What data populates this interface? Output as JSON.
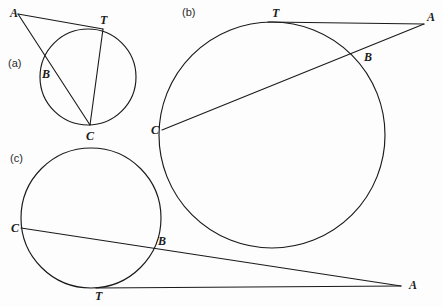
{
  "figure": {
    "background_color": "#fdfdfd",
    "stroke_color": "#1a1a1a",
    "width": 442,
    "height": 307,
    "caption_font_color": "#2a2a2a",
    "panels": [
      {
        "id": "a",
        "caption": "(a)",
        "caption_x": 8,
        "caption_y": 67,
        "circle": {
          "cx": 88,
          "cy": 77,
          "r": 48
        },
        "points": [
          {
            "name": "A",
            "label": "A",
            "x": 18,
            "y": 14,
            "label_x": 10,
            "label_y": 17
          },
          {
            "name": "T",
            "label": "T",
            "x": 103,
            "y": 29,
            "label_x": 100,
            "label_y": 24
          },
          {
            "name": "B",
            "label": "B",
            "x": 53,
            "y": 72,
            "label_x": 42,
            "label_y": 78
          },
          {
            "name": "C",
            "label": "C",
            "x": 90,
            "y": 125,
            "label_x": 86,
            "label_y": 140
          }
        ],
        "segments": [
          {
            "name": "tangent-AT",
            "from": "A",
            "to": "T"
          },
          {
            "name": "secant-ABC",
            "from": "A",
            "to": "C"
          },
          {
            "name": "chord-TC",
            "from": "T",
            "to": "C"
          }
        ]
      },
      {
        "id": "b",
        "caption": "(b)",
        "caption_x": 182,
        "caption_y": 16,
        "circle": {
          "cx": 272,
          "cy": 135,
          "r": 113
        },
        "points": [
          {
            "name": "A",
            "label": "A",
            "x": 424,
            "y": 24,
            "label_x": 427,
            "label_y": 21
          },
          {
            "name": "T",
            "label": "T",
            "x": 278,
            "y": 22,
            "label_x": 272,
            "label_y": 17
          },
          {
            "name": "B",
            "label": "B",
            "x": 354,
            "y": 52,
            "label_x": 364,
            "label_y": 61
          },
          {
            "name": "C",
            "label": "C",
            "x": 164,
            "y": 130,
            "label_x": 153,
            "label_y": 134
          }
        ],
        "segments": [
          {
            "name": "tangent-AT",
            "from": "A",
            "to": "T"
          },
          {
            "name": "secant-ABC",
            "from": "A",
            "to": "C"
          }
        ]
      },
      {
        "id": "c",
        "caption": "(c)",
        "caption_x": 10,
        "caption_y": 162,
        "circle": {
          "cx": 91,
          "cy": 218,
          "r": 70
        },
        "points": [
          {
            "name": "A",
            "label": "A",
            "x": 400,
            "y": 285,
            "label_x": 409,
            "label_y": 289
          },
          {
            "name": "T",
            "label": "T",
            "x": 100,
            "y": 287,
            "label_x": 95,
            "label_y": 300
          },
          {
            "name": "B",
            "label": "B",
            "x": 152,
            "y": 246,
            "label_x": 158,
            "label_y": 245
          },
          {
            "name": "C",
            "label": "C",
            "x": 22,
            "y": 228,
            "label_x": 12,
            "label_y": 232
          }
        ],
        "segments": [
          {
            "name": "tangent-TA",
            "from": "T",
            "to": "A"
          },
          {
            "name": "secant-CBA",
            "from": "C",
            "to": "A"
          }
        ]
      }
    ]
  }
}
